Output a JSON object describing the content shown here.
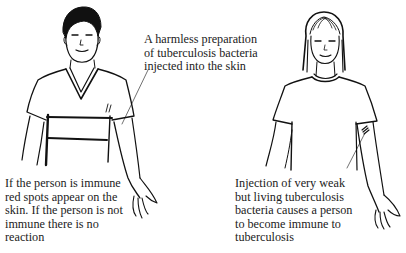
{
  "figure": {
    "type": "illustration",
    "figures": [
      {
        "id": "left-person",
        "description": "young man in V-neck t-shirt, left arm extended with injection site"
      },
      {
        "id": "right-person",
        "description": "young woman with long hair in crew-neck t-shirt, left arm with injection site"
      }
    ],
    "colors": {
      "ink": "#111111",
      "text": "#222222",
      "background": "#ffffff"
    }
  },
  "captions": {
    "top": {
      "lines": [
        "A harmless preparation",
        "of tuberculosis bacteria",
        "injected into the skin"
      ]
    },
    "left": {
      "lines": [
        "If the person is immune",
        "red spots appear on the",
        "skin. If the person is not",
        "immune there is no",
        "reaction"
      ]
    },
    "right": {
      "lines": [
        "Injection of very weak",
        "but living tuberculosis",
        "bacteria causes a person",
        "to become immune to",
        "tuberculosis"
      ]
    }
  }
}
